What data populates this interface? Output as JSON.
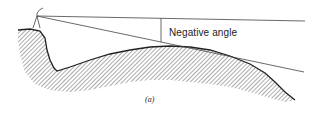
{
  "diagram": {
    "angle_label": "Negative angle",
    "caption": "(a)",
    "elements": [
      "observer-point",
      "horizontal-reference-line",
      "sight-line",
      "angle-arc-marker",
      "terrain-profile",
      "hatched-ground"
    ]
  },
  "colors": {
    "line": "#333333",
    "background": "#ffffff"
  }
}
